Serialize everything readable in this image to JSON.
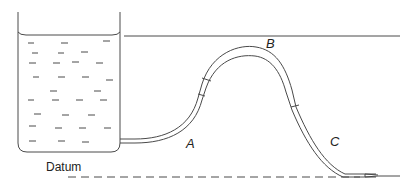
{
  "diagram": {
    "type": "siphon",
    "labels": {
      "a": "A",
      "b": "B",
      "c": "C",
      "datum": "Datum"
    },
    "colors": {
      "stroke": "#4a4a4a",
      "text": "#222222",
      "background": "#ffffff"
    }
  }
}
